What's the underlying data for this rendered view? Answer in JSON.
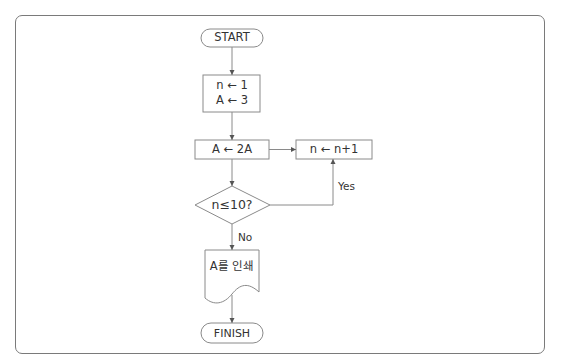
{
  "flowchart": {
    "start": {
      "label": "START"
    },
    "init": {
      "line1": "n ← 1",
      "line2": "A ← 3"
    },
    "double": {
      "label": "A ← 2A"
    },
    "increment": {
      "label": "n ← n+1"
    },
    "decision": {
      "label": "n≤10?"
    },
    "yes_label": "Yes",
    "no_label": "No",
    "output": {
      "label": "A를 인쇄"
    },
    "finish": {
      "label": "FINISH"
    }
  },
  "colors": {
    "stroke": "#7a7a7a",
    "text": "#333333",
    "background": "#ffffff"
  }
}
